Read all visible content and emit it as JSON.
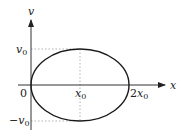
{
  "diagram": {
    "type": "phase-space ellipse",
    "axes": {
      "x_label": "x",
      "y_label": "v"
    },
    "labels": {
      "origin": "0",
      "x0_base": "x",
      "x0_sub": "0",
      "two_x0_prefix": "2",
      "two_x0_base": "x",
      "two_x0_sub": "0",
      "v0_base": "v",
      "v0_sub": "0",
      "neg_v0_sign": "−",
      "neg_v0_base": "v",
      "neg_v0_sub": "0"
    },
    "ellipse": {
      "center": "x0",
      "x_extent": [
        "0",
        "2x0"
      ],
      "v_extent": [
        "-v0",
        "v0"
      ]
    },
    "colors": {
      "curve": "#1a1a1a",
      "axes": "#333333",
      "guides": "#aaaaaa"
    }
  }
}
